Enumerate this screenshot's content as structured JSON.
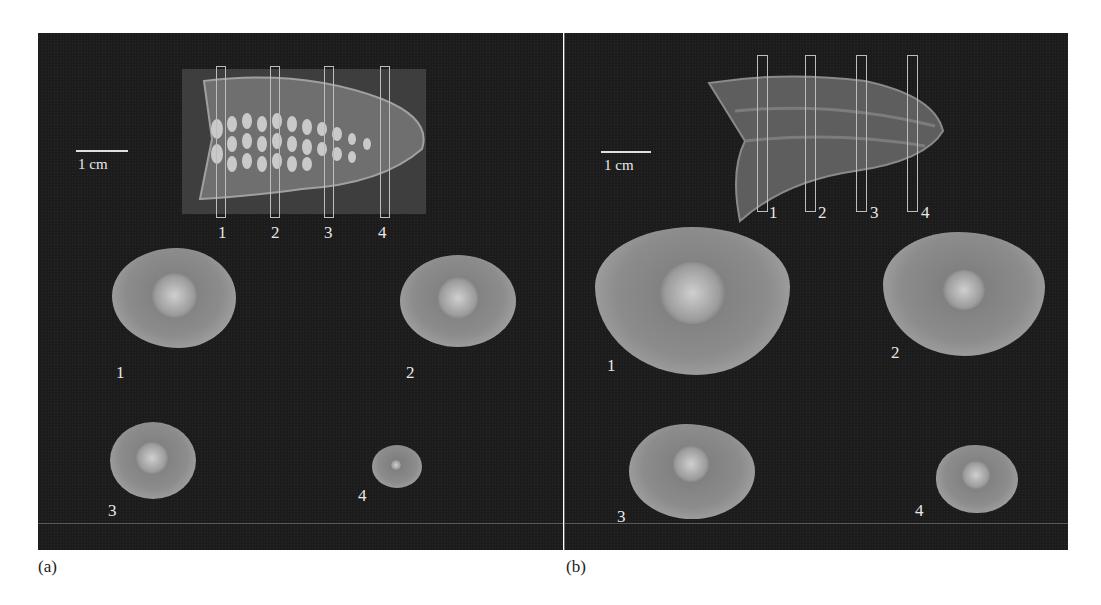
{
  "figure": {
    "panels": [
      {
        "id": "a",
        "panel_label": "(a)",
        "scale_bar_label": "1 cm",
        "slice_markers": [
          "1",
          "2",
          "3",
          "4"
        ],
        "cross_section_labels": [
          "1",
          "2",
          "3",
          "4"
        ]
      },
      {
        "id": "b",
        "panel_label": "(b)",
        "scale_bar_label": "1 cm",
        "slice_markers": [
          "1",
          "2",
          "3",
          "4"
        ],
        "cross_section_labels": [
          "1",
          "2",
          "3",
          "4"
        ]
      }
    ]
  },
  "colors": {
    "background": "#1c1c1c",
    "text": "#e8e8e8",
    "tissue": "#8c8c8c"
  }
}
